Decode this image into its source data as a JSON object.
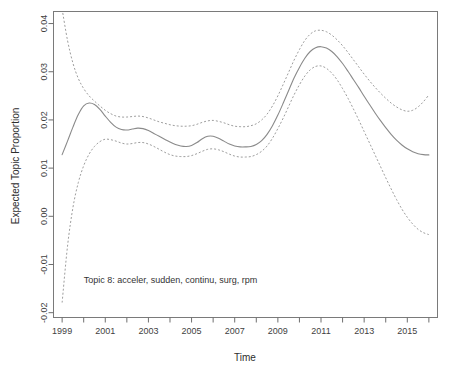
{
  "chart_data": {
    "type": "line",
    "title": "",
    "xlabel": "Time",
    "ylabel": "Expected Topic Proportion",
    "xlim": [
      1998.6,
      2016.4
    ],
    "ylim": [
      -0.021,
      0.0425
    ],
    "grid": false,
    "legend": null,
    "annotations": [
      {
        "text": "Topic 8: acceler, sudden, continu, surg, rpm",
        "x": 2000.0,
        "y": -0.0138
      }
    ],
    "x_ticks_major": [
      1999,
      2001,
      2003,
      2005,
      2007,
      2009,
      2011,
      2013,
      2015
    ],
    "x_tick_labels": [
      "1999",
      "2001",
      "2003",
      "2005",
      "2007",
      "2009",
      "2011",
      "2013",
      "2015"
    ],
    "x_ticks_minor": [
      2000,
      2002,
      2004,
      2006,
      2008,
      2010,
      2012,
      2014,
      2016
    ],
    "y_ticks": [
      0.04,
      0.03,
      0.02,
      0.01,
      0.0,
      -0.01,
      -0.02
    ],
    "y_tick_labels": [
      "0.04",
      "0.03",
      "0.02",
      "0.01",
      "0.00",
      "-0.01",
      "-0.02"
    ],
    "x": [
      1999.0,
      1999.25,
      1999.5,
      1999.75,
      2000.0,
      2000.25,
      2000.5,
      2000.75,
      2001.0,
      2001.25,
      2001.5,
      2001.75,
      2002.0,
      2002.25,
      2002.5,
      2002.75,
      2003.0,
      2003.25,
      2003.5,
      2003.75,
      2004.0,
      2004.25,
      2004.5,
      2004.75,
      2005.0,
      2005.25,
      2005.5,
      2005.75,
      2006.0,
      2006.25,
      2006.5,
      2006.75,
      2007.0,
      2007.25,
      2007.5,
      2007.75,
      2008.0,
      2008.25,
      2008.5,
      2008.75,
      2009.0,
      2009.25,
      2009.5,
      2009.75,
      2010.0,
      2010.25,
      2010.5,
      2010.75,
      2011.0,
      2011.25,
      2011.5,
      2011.75,
      2012.0,
      2012.25,
      2012.5,
      2012.75,
      2013.0,
      2013.25,
      2013.5,
      2013.75,
      2014.0,
      2014.25,
      2014.5,
      2014.75,
      2015.0,
      2015.25,
      2015.5,
      2015.75,
      2016.0
    ],
    "series": [
      {
        "name": "mean",
        "style": "solid",
        "values": [
          0.0128,
          0.0156,
          0.0185,
          0.0211,
          0.0229,
          0.0235,
          0.0232,
          0.0222,
          0.0208,
          0.0195,
          0.0185,
          0.018,
          0.0179,
          0.0181,
          0.0183,
          0.0182,
          0.0178,
          0.0172,
          0.0166,
          0.016,
          0.0154,
          0.0149,
          0.0146,
          0.0145,
          0.0147,
          0.0153,
          0.0161,
          0.0166,
          0.0166,
          0.0162,
          0.0156,
          0.015,
          0.0146,
          0.0144,
          0.0144,
          0.0145,
          0.0149,
          0.0157,
          0.017,
          0.0188,
          0.021,
          0.0235,
          0.0261,
          0.0287,
          0.0309,
          0.0328,
          0.0342,
          0.035,
          0.0352,
          0.0349,
          0.0342,
          0.0331,
          0.0317,
          0.0301,
          0.0284,
          0.0267,
          0.0249,
          0.0232,
          0.0215,
          0.0199,
          0.0184,
          0.017,
          0.0158,
          0.0148,
          0.014,
          0.0134,
          0.013,
          0.0128,
          0.01275
        ]
      },
      {
        "name": "upper-95ci",
        "style": "dashed",
        "values": [
          0.043,
          0.0365,
          0.0318,
          0.0286,
          0.0265,
          0.025,
          0.0239,
          0.0229,
          0.022,
          0.0213,
          0.0208,
          0.0206,
          0.0206,
          0.0207,
          0.0208,
          0.0207,
          0.0204,
          0.02,
          0.0196,
          0.0193,
          0.019,
          0.0188,
          0.0187,
          0.0187,
          0.0188,
          0.0191,
          0.0195,
          0.0198,
          0.0199,
          0.0197,
          0.0194,
          0.019,
          0.0187,
          0.0186,
          0.0186,
          0.0188,
          0.0192,
          0.02,
          0.0212,
          0.0229,
          0.025,
          0.0274,
          0.0299,
          0.0324,
          0.0346,
          0.0365,
          0.0378,
          0.0385,
          0.0386,
          0.0383,
          0.0376,
          0.0366,
          0.0354,
          0.034,
          0.0325,
          0.031,
          0.0295,
          0.0281,
          0.0268,
          0.0256,
          0.0245,
          0.0235,
          0.0227,
          0.0221,
          0.0218,
          0.022,
          0.0227,
          0.0238,
          0.0252
        ]
      },
      {
        "name": "lower-95ci",
        "style": "dashed",
        "values": [
          -0.0179,
          -0.0062,
          0.0018,
          0.007,
          0.0105,
          0.0129,
          0.0145,
          0.0155,
          0.016,
          0.0159,
          0.0156,
          0.0152,
          0.015,
          0.0151,
          0.0153,
          0.0153,
          0.015,
          0.0145,
          0.0139,
          0.0133,
          0.0128,
          0.0125,
          0.0124,
          0.0124,
          0.0126,
          0.013,
          0.0135,
          0.0139,
          0.014,
          0.0138,
          0.0134,
          0.0129,
          0.0125,
          0.0123,
          0.0123,
          0.0124,
          0.0128,
          0.0135,
          0.0146,
          0.0162,
          0.0182,
          0.0204,
          0.0228,
          0.0252,
          0.0273,
          0.0291,
          0.0304,
          0.0311,
          0.0312,
          0.0307,
          0.0297,
          0.0283,
          0.0265,
          0.0245,
          0.0223,
          0.02,
          0.0176,
          0.0152,
          0.0128,
          0.0104,
          0.008,
          0.0057,
          0.0035,
          0.0015,
          -0.0002,
          -0.0016,
          -0.0027,
          -0.0034,
          -0.0038
        ]
      }
    ]
  },
  "axes": {
    "x_title": "Time",
    "y_title": "Expected Topic Proportion"
  }
}
